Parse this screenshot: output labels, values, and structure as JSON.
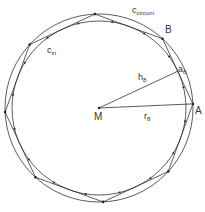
{
  "diagram": {
    "type": "inscribed-circumscribed-polygon",
    "center": {
      "label": "M",
      "x": 99,
      "y": 108
    },
    "circles": [
      {
        "name": "circumcircle",
        "label": "c",
        "sub": "circum",
        "radius": 94
      },
      {
        "name": "incircle",
        "label": "c",
        "sub": "in",
        "radius": 87
      }
    ],
    "polygon": {
      "sides": 8,
      "start_angle_deg": -2.5
    },
    "points": [
      {
        "label": "A"
      },
      {
        "label": "B"
      }
    ],
    "segments": [
      {
        "label": "r",
        "sub": "8"
      },
      {
        "label": "h",
        "sub": "8"
      },
      {
        "label": "a",
        "sub": "8"
      }
    ],
    "colors": {
      "stroke": "#333333",
      "background": "#ffffff"
    }
  },
  "labels": {
    "c_circum": "c",
    "c_circum_sub": "circum",
    "c_in": "c",
    "c_in_sub": "in",
    "B": "B",
    "A": "A",
    "M": "M",
    "r8": "r",
    "r8_sub": "8",
    "h8": "h",
    "h8_sub": "8",
    "a8": "a",
    "a8_sub": "8"
  }
}
